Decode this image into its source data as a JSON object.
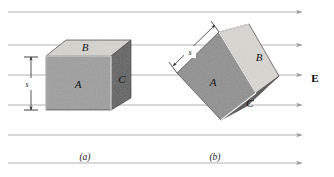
{
  "figure": {
    "type": "physics-diagram",
    "panels": [
      {
        "id": "a",
        "label": "(a)",
        "caption_x": 85,
        "caption_y": 160
      },
      {
        "id": "b",
        "label": "(b)",
        "caption_x": 215,
        "caption_y": 160
      }
    ],
    "field": {
      "symbol": "E",
      "label_x": 315,
      "label_y": 82,
      "direction": "left-to-right",
      "line_count": 6,
      "line_y": [
        12,
        45,
        75,
        105,
        135,
        163
      ],
      "line_color": "#a8a8a8",
      "arrowhead_color": "#9a9a9a"
    },
    "cube_a": {
      "faces": [
        {
          "name": "A",
          "role": "front-face",
          "label": "A",
          "label_x": 78,
          "label_y": 88,
          "fill": "#9e9e9e"
        },
        {
          "name": "B",
          "role": "top-face",
          "label": "B",
          "label_x": 85,
          "label_y": 48,
          "fill": "#d6d4cf"
        },
        {
          "name": "C",
          "role": "right-face",
          "label": "C",
          "label_x": 122,
          "label_y": 82,
          "fill": "#5e5e5e"
        }
      ],
      "dimension": {
        "symbol": "s",
        "label_x": 26,
        "label_y": 86,
        "top_y": 57,
        "bottom_y": 110,
        "x": 31
      }
    },
    "cube_b": {
      "rotated": true,
      "faces": [
        {
          "name": "A",
          "role": "front-face",
          "label": "A",
          "label_x": 213,
          "label_y": 83,
          "fill": "#8f8f8f"
        },
        {
          "name": "B",
          "role": "top-face",
          "label": "B",
          "label_x": 258,
          "label_y": 58,
          "fill": "#d9d7d2"
        },
        {
          "name": "C",
          "role": "right-face",
          "label": "C",
          "label_x": 250,
          "label_y": 105,
          "fill": "#5a5a5a"
        }
      ],
      "dimension": {
        "symbol": "s",
        "label_x": 189,
        "label_y": 54
      }
    },
    "colors": {
      "field_line": "#a8a8a8",
      "edge_dark": "#2b2b2b",
      "edge_light": "#f2f2f2",
      "face_front_a": "#9e9e9e",
      "face_top_b": "#d6d4cf",
      "face_side_c": "#5e5e5e",
      "background": "#ffffff"
    }
  }
}
